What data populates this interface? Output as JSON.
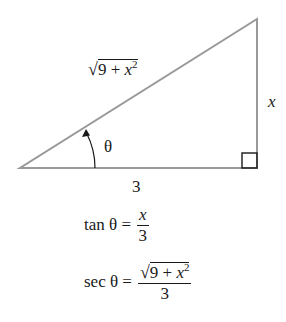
{
  "diagram": {
    "type": "right-triangle",
    "line_color": "#999999",
    "text_color": "#1a1a1a",
    "vertices": {
      "bottom_left": [
        20,
        168
      ],
      "bottom_right": [
        257,
        168
      ],
      "top_right": [
        257,
        19
      ]
    },
    "labels": {
      "hypotenuse": {
        "radicand_prefix": "9 + ",
        "var": "x",
        "exp": "2"
      },
      "opposite": "x",
      "adjacent": "3",
      "angle": "θ"
    },
    "right_angle_marker": true
  },
  "equations": [
    {
      "lhs": "tan θ =",
      "numerator": "x",
      "denominator": "3"
    },
    {
      "lhs": "sec θ =",
      "numerator_prefix": "9 + ",
      "numerator_var": "x",
      "numerator_exp": "2",
      "denominator": "3"
    }
  ]
}
